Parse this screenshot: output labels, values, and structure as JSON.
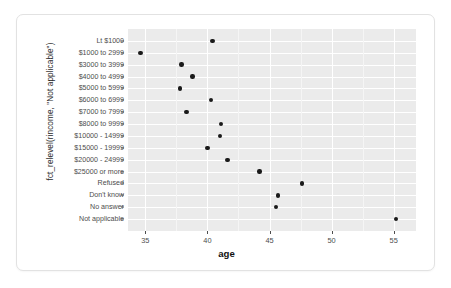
{
  "chart_data": {
    "type": "scatter",
    "title": "",
    "xlabel": "age",
    "ylabel": "fct_relevel(rincome, \"Not applicable\")",
    "xlim": [
      33.6,
      56.8
    ],
    "xticks": [
      "35",
      "40",
      "45",
      "50",
      "55"
    ],
    "xtickvalues": [
      35,
      40,
      45,
      50,
      55
    ],
    "grid": true,
    "legend": "none",
    "categories": [
      "Lt $1000",
      "$1000 to 2999",
      "$3000 to 3999",
      "$4000 to 4999",
      "$5000 to 5999",
      "$6000 to 6999",
      "$7000 to 7999",
      "$8000 to 9999",
      "$10000 - 14999",
      "$15000 - 19999",
      "$20000 - 24999",
      "$25000 or more",
      "Refused",
      "Don't know",
      "No answer",
      "Not applicable"
    ],
    "values": [
      40.4,
      34.6,
      37.9,
      38.8,
      37.8,
      40.3,
      38.3,
      41.1,
      41.0,
      40.0,
      41.6,
      44.2,
      47.6,
      45.7,
      45.5,
      55.2
    ],
    "points": [
      {
        "category": "Lt $1000",
        "age": 40.4
      },
      {
        "category": "$1000 to 2999",
        "age": 34.6
      },
      {
        "category": "$3000 to 3999",
        "age": 37.9
      },
      {
        "category": "$4000 to 4999",
        "age": 38.8
      },
      {
        "category": "$5000 to 5999",
        "age": 37.8
      },
      {
        "category": "$6000 to 6999",
        "age": 40.3
      },
      {
        "category": "$7000 to 7999",
        "age": 38.3
      },
      {
        "category": "$8000 to 9999",
        "age": 41.1
      },
      {
        "category": "$10000 - 14999",
        "age": 41.0
      },
      {
        "category": "$15000 - 19999",
        "age": 40.0
      },
      {
        "category": "$20000 - 24999",
        "age": 41.6
      },
      {
        "category": "$25000 or more",
        "age": 44.2
      },
      {
        "category": "Refused",
        "age": 47.6
      },
      {
        "category": "Don't know",
        "age": 45.7
      },
      {
        "category": "No answer",
        "age": 45.5
      },
      {
        "category": "Not applicable",
        "age": 55.2
      }
    ],
    "colors": {
      "point": "#1a1a1a",
      "panel_background": "#ebebeb",
      "gridline_major": "#ffffff",
      "gridline_minor": "#f5f5f5",
      "axis_text": "#4d4d4d",
      "card_background": "#ffffff",
      "card_border": "#e2e2e2"
    }
  }
}
